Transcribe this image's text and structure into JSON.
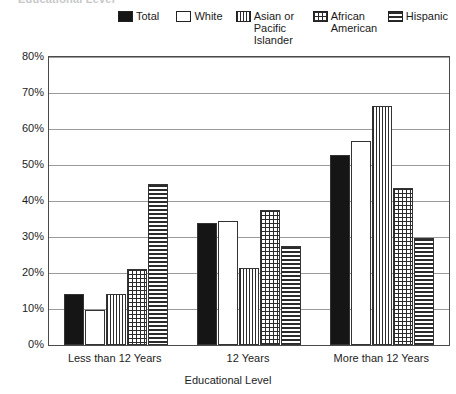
{
  "chart_data": {
    "type": "bar",
    "title": "Educational Level",
    "title_clipped": "Educational Level",
    "xlabel": "Educational Level",
    "ylabel": "",
    "categories": [
      "Less than 12 Years",
      "12 Years",
      "More than 12 Years"
    ],
    "ylim": [
      0,
      80
    ],
    "ytick_labels": [
      "0%",
      "10%",
      "20%",
      "30%",
      "40%",
      "50%",
      "60%",
      "70%",
      "80%"
    ],
    "ytick_values": [
      0,
      10,
      20,
      30,
      40,
      50,
      60,
      70,
      80
    ],
    "grid": true,
    "legend_position": "top",
    "series": [
      {
        "name": "Total",
        "pattern": "solid",
        "values": [
          14.2,
          33.8,
          52.8
        ]
      },
      {
        "name": "White",
        "pattern": "empty",
        "values": [
          9.8,
          34.5,
          56.8
        ]
      },
      {
        "name": "Asian or\nPacific\nIslander",
        "pattern": "vertical-lines",
        "values": [
          14.2,
          21.5,
          66.3
        ]
      },
      {
        "name": "African\nAmerican",
        "pattern": "dots",
        "values": [
          21.0,
          37.5,
          43.5
        ]
      },
      {
        "name": "Hispanic",
        "pattern": "horizontal-lines",
        "values": [
          44.8,
          27.5,
          29.8
        ]
      }
    ]
  },
  "legend": {
    "items": [
      {
        "label": "Total",
        "swatch": "swatch-solid-icon"
      },
      {
        "label": "White",
        "swatch": "swatch-empty-icon"
      },
      {
        "label": "Asian or\nPacific\nIslander",
        "swatch": "swatch-vertical-lines-icon"
      },
      {
        "label": "African\nAmerican",
        "swatch": "swatch-dots-icon"
      },
      {
        "label": "Hispanic",
        "swatch": "swatch-horizontal-lines-icon"
      }
    ]
  },
  "colors": {
    "bar_outline": "#333333",
    "solid_fill": "#151515",
    "pattern_ink": "#2b2b2b",
    "gridline": "#9b9b9b",
    "axis": "#4a4a4a",
    "background": "#ffffff",
    "text": "#1d1d1d"
  }
}
